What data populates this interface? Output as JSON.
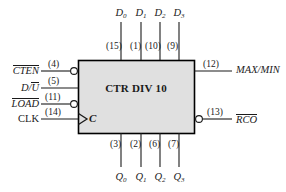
{
  "diagram": {
    "title": "CTR DIV 10",
    "block": {
      "x": 78,
      "y": 60,
      "width": 116,
      "height": 73,
      "fill": "#e0e0e0",
      "stroke": "#000000"
    },
    "clock_label": "C",
    "top_inputs": [
      {
        "name": "D",
        "subscript": "0",
        "pin": "(15)",
        "line_x": 121
      },
      {
        "name": "D",
        "subscript": "1",
        "pin": "(1)",
        "line_x": 141
      },
      {
        "name": "D",
        "subscript": "2",
        "pin": "(10)",
        "line_x": 160
      },
      {
        "name": "D",
        "subscript": "3",
        "pin": "(9)",
        "line_x": 179
      }
    ],
    "left_inputs": [
      {
        "name": "CTEN",
        "overbar": "full",
        "pin": "(4)",
        "bubble": true,
        "clock": false,
        "y": 71
      },
      {
        "name": "D/U",
        "overbar": "partial",
        "pin": "(5)",
        "bubble": false,
        "clock": false,
        "y": 88
      },
      {
        "name": "LOAD",
        "overbar": "full",
        "pin": "(11)",
        "bubble": true,
        "clock": false,
        "y": 104
      },
      {
        "name": "CLK",
        "overbar": "none",
        "pin": "(14)",
        "bubble": false,
        "clock": true,
        "y": 119
      }
    ],
    "right_outputs": [
      {
        "name": "MAX/MIN",
        "overbar": "none",
        "pin": "(12)",
        "bubble": false,
        "y": 71
      },
      {
        "name": "RCO",
        "overbar": "full",
        "pin": "(13)",
        "bubble": true,
        "y": 119
      }
    ],
    "bottom_outputs": [
      {
        "name": "Q",
        "subscript": "0",
        "pin": "(3)",
        "line_x": 121
      },
      {
        "name": "Q",
        "subscript": "1",
        "pin": "(2)",
        "line_x": 141
      },
      {
        "name": "Q",
        "subscript": "2",
        "pin": "(6)",
        "line_x": 160
      },
      {
        "name": "Q",
        "subscript": "3",
        "pin": "(7)",
        "line_x": 179
      }
    ]
  }
}
